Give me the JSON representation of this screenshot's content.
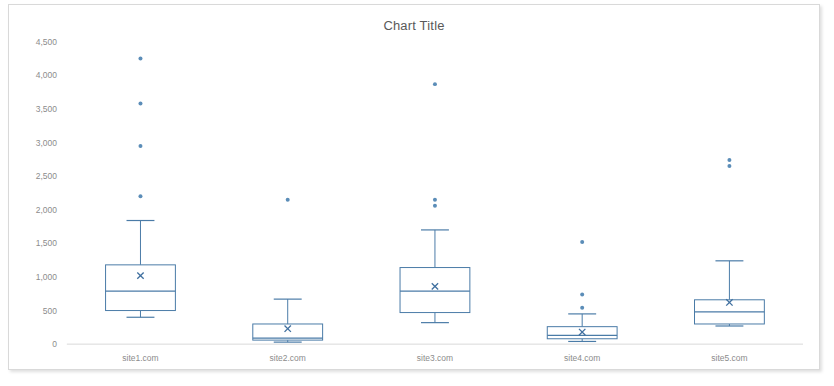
{
  "chart_data": {
    "type": "box",
    "title": "Chart Title",
    "xlabel": "",
    "ylabel": "",
    "ylim": [
      0,
      4500
    ],
    "y_ticks": [
      0,
      500,
      1000,
      1500,
      2000,
      2500,
      3000,
      3500,
      4000,
      4500
    ],
    "y_tick_labels": [
      "0",
      "500",
      "1,000",
      "1,500",
      "2,000",
      "2,500",
      "3,000",
      "3,500",
      "4,000",
      "4,500"
    ],
    "grid": false,
    "legend": null,
    "categories": [
      "site1.com",
      "site2.com",
      "site3.com",
      "site4.com",
      "site5.com"
    ],
    "series": [
      {
        "name": "site1.com",
        "whisker_low": 400,
        "q1": 500,
        "median": 790,
        "q3": 1180,
        "whisker_high": 1840,
        "mean": 1020,
        "outliers": [
          2200,
          2950,
          3580,
          4250
        ]
      },
      {
        "name": "site2.com",
        "whisker_low": 30,
        "q1": 60,
        "median": 90,
        "q3": 300,
        "whisker_high": 670,
        "mean": 230,
        "outliers": [
          2150
        ]
      },
      {
        "name": "site3.com",
        "whisker_low": 320,
        "q1": 470,
        "median": 790,
        "q3": 1140,
        "whisker_high": 1700,
        "mean": 860,
        "outliers": [
          2060,
          2150,
          3870
        ]
      },
      {
        "name": "site4.com",
        "whisker_low": 40,
        "q1": 80,
        "median": 130,
        "q3": 260,
        "whisker_high": 450,
        "mean": 180,
        "outliers": [
          540,
          740,
          1520
        ]
      },
      {
        "name": "site5.com",
        "whisker_low": 270,
        "q1": 300,
        "median": 480,
        "q3": 660,
        "whisker_high": 1240,
        "mean": 620,
        "outliers": [
          2650,
          2740
        ]
      }
    ],
    "colors": {
      "box_stroke": "#4a7ba7",
      "outlier": "#5b8db8",
      "mean_marker": "#3f6f9f",
      "axis": "#d9d9d9",
      "tick_label": "#8c8c8c",
      "title": "#595959",
      "plot_background": "#ffffff",
      "frame_border": "#d9d9d9"
    }
  }
}
